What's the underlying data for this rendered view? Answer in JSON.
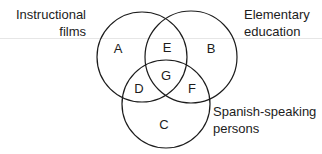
{
  "diagram": {
    "type": "venn",
    "sets": [
      {
        "id": "A",
        "label_lines": [
          "Instructional",
          "films"
        ]
      },
      {
        "id": "B",
        "label_lines": [
          "Elementary",
          "education"
        ]
      },
      {
        "id": "C",
        "label_lines": [
          "Spanish-speaking",
          "persons"
        ]
      }
    ],
    "regions": {
      "A": "A",
      "B": "B",
      "C": "C",
      "D": "D",
      "E": "E",
      "F": "F",
      "G": "G"
    },
    "colors": {
      "stroke": "#1c1c1c",
      "background": "#ffffff"
    }
  }
}
